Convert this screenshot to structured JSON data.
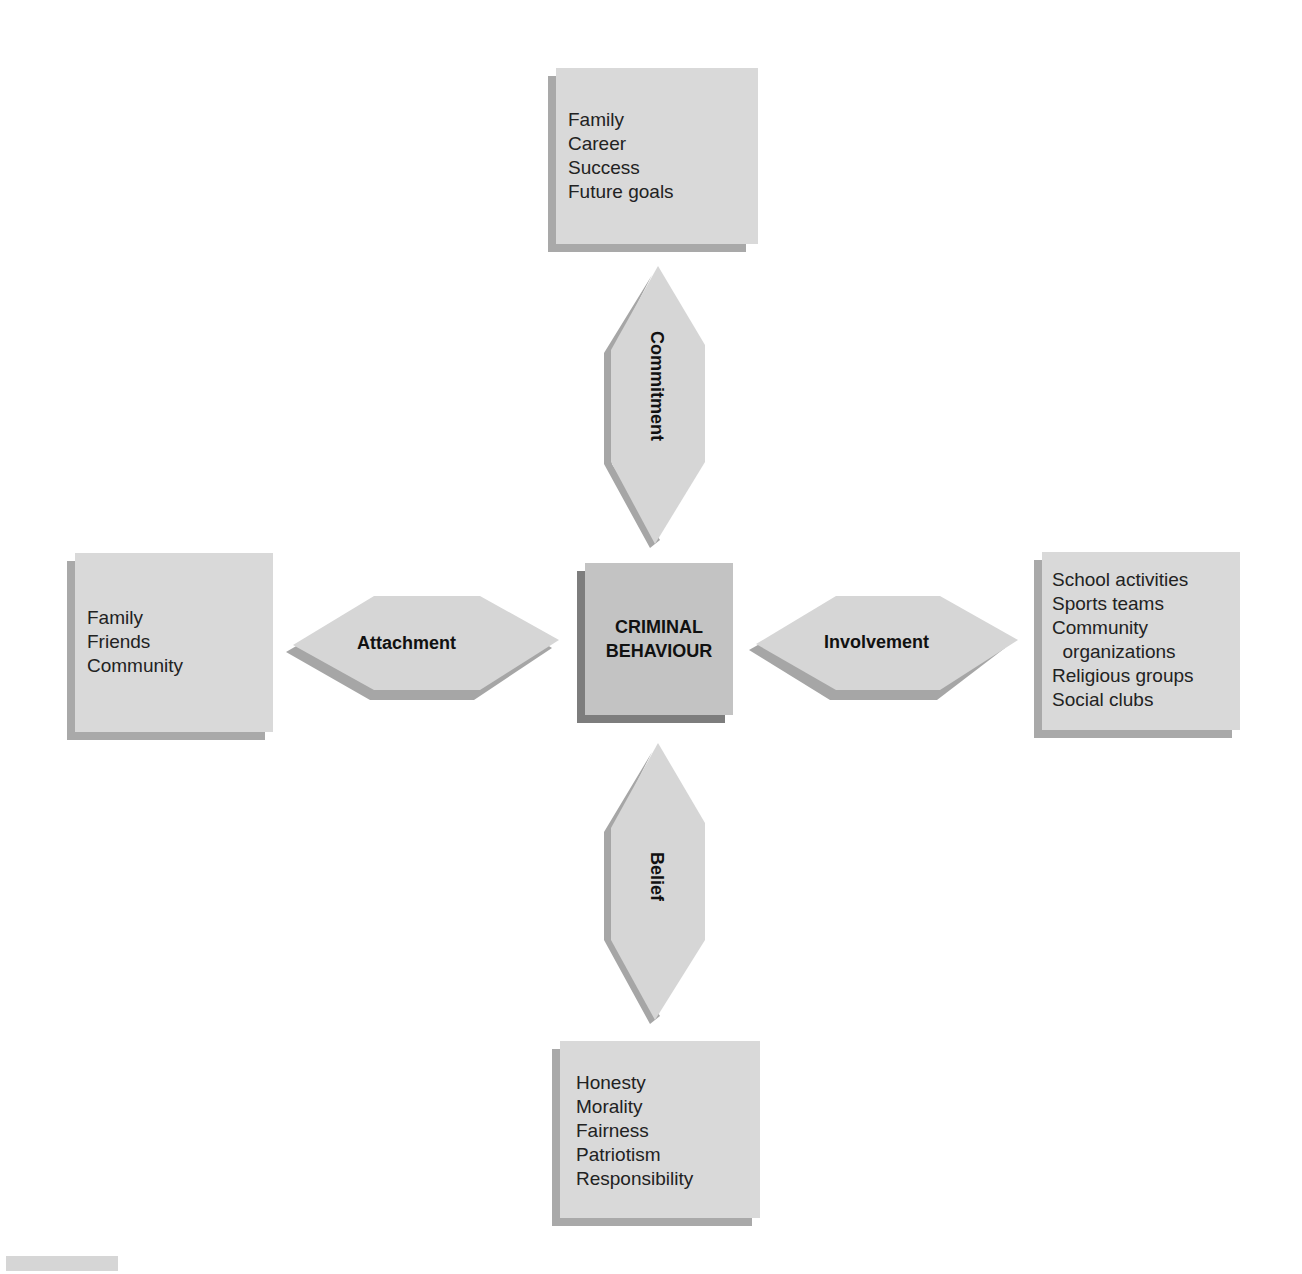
{
  "diagram": {
    "type": "social-bond-theory",
    "center": {
      "label_line1": "CRIMINAL",
      "label_line2": "BEHAVIOUR"
    },
    "connectors": {
      "top": {
        "label": "Commitment"
      },
      "left": {
        "label": "Attachment"
      },
      "right": {
        "label": "Involvement"
      },
      "bottom": {
        "label": "Belief"
      }
    },
    "boxes": {
      "top": {
        "items": [
          "Family",
          "Career",
          "Success",
          "Future goals"
        ]
      },
      "left": {
        "items": [
          "Family",
          "Friends",
          "Community"
        ]
      },
      "right": {
        "items": [
          "School activities",
          "Sports teams",
          "Community",
          "  organizations",
          "Religious groups",
          "Social clubs"
        ]
      },
      "bottom": {
        "items": [
          "Honesty",
          "Morality",
          "Fairness",
          "Patriotism",
          "Responsibility"
        ]
      }
    },
    "colors": {
      "box_face": "#d9d9d9",
      "box_shadow": "#a9a9a9",
      "center_face": "#c3c3c3",
      "center_shadow": "#7d7d7d",
      "connector_face": "#d6d6d6",
      "connector_shadow": "#a6a6a6"
    }
  }
}
